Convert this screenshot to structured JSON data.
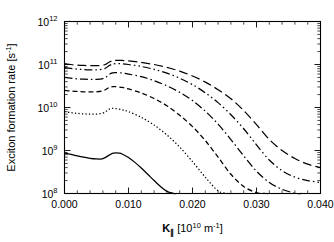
{
  "figure": {
    "background_color": "#ffffff",
    "line_color": "#000000"
  },
  "chart_data": {
    "type": "line",
    "title": "",
    "xlabel": "K∥ [10¹⁰ m⁻¹]",
    "ylabel": "Exciton formation rate [s⁻¹]",
    "xlabel_parts": {
      "symbol": "K",
      "subscript": "∥",
      "units_prefix": " [10",
      "units_exp": "10",
      "units_mid": " m",
      "units_exp2": "-1",
      "units_suffix": "]"
    },
    "ylabel_parts": {
      "text": "Exciton formation rate [s",
      "exp": "-1",
      "suffix": "]"
    },
    "xscale": "linear",
    "yscale": "log",
    "xlim": [
      0.0,
      0.04
    ],
    "ylim": [
      100000000.0,
      1000000000000.0
    ],
    "grid": false,
    "legend": "none",
    "xticks": [
      0.0,
      0.01,
      0.02,
      0.03,
      0.04
    ],
    "xticklabels": [
      "0.000",
      "0.010",
      "0.020",
      "0.030",
      "0.040"
    ],
    "x_minor_ticks_per_interval": 5,
    "yticks": [
      100000000.0,
      1000000000.0,
      10000000000.0,
      100000000000.0,
      1000000000000.0
    ],
    "yticklabels_base": [
      "10",
      "10",
      "10",
      "10",
      "10"
    ],
    "yticklabels_exp": [
      "8",
      "9",
      "10",
      "11",
      "12"
    ],
    "series": [
      {
        "name": "curve-long-dash",
        "linestyle": "long-dash",
        "dasharray": "9,4",
        "x": [
          0.0,
          0.001,
          0.002,
          0.003,
          0.004,
          0.005,
          0.006,
          0.0065,
          0.007,
          0.0075,
          0.008,
          0.009,
          0.01,
          0.012,
          0.014,
          0.016,
          0.018,
          0.02,
          0.022,
          0.024,
          0.026,
          0.028,
          0.03,
          0.032,
          0.034,
          0.036,
          0.038,
          0.04
        ],
        "y": [
          105000000000.0,
          100000000000.0,
          97000000000.0,
          95000000000.0,
          94000000000.0,
          94000000000.0,
          96000000000.0,
          102000000000.0,
          114000000000.0,
          122000000000.0,
          125000000000.0,
          124000000000.0,
          121000000000.0,
          112000000000.0,
          100000000000.0,
          86000000000.0,
          70000000000.0,
          54000000000.0,
          39000000000.0,
          26000000000.0,
          16000000000.0,
          8500000000.0,
          4000000000.0,
          1800000000.0,
          1000000000.0,
          650000000.0,
          480000000.0,
          400000000.0
        ]
      },
      {
        "name": "curve-dash-dot-dot",
        "linestyle": "dash-dot-dot",
        "dasharray": "8,3,1.5,3,1.5,3",
        "x": [
          0.0,
          0.001,
          0.002,
          0.003,
          0.004,
          0.005,
          0.006,
          0.0065,
          0.007,
          0.0075,
          0.008,
          0.009,
          0.01,
          0.012,
          0.014,
          0.016,
          0.018,
          0.02,
          0.022,
          0.024,
          0.026,
          0.028,
          0.03,
          0.032,
          0.034,
          0.036,
          0.038,
          0.04
        ],
        "y": [
          85000000000.0,
          81000000000.0,
          78000000000.0,
          76000000000.0,
          75000000000.0,
          75000000000.0,
          78000000000.0,
          84000000000.0,
          95000000000.0,
          102000000000.0,
          105000000000.0,
          104000000000.0,
          100000000000.0,
          90000000000.0,
          77000000000.0,
          63000000000.0,
          48000000000.0,
          34000000000.0,
          22000000000.0,
          13000000000.0,
          6800000000.0,
          3200000000.0,
          1350000000.0,
          600000000.0,
          340000000.0,
          240000000.0,
          200000000.0,
          180000000.0
        ]
      },
      {
        "name": "curve-dash-dot",
        "linestyle": "dash-dot",
        "dasharray": "8,3,1.5,3",
        "x": [
          0.0,
          0.001,
          0.002,
          0.003,
          0.004,
          0.005,
          0.006,
          0.0065,
          0.007,
          0.0075,
          0.008,
          0.009,
          0.01,
          0.012,
          0.014,
          0.016,
          0.018,
          0.02,
          0.022,
          0.024,
          0.026,
          0.028,
          0.03,
          0.032,
          0.034,
          0.036,
          0.037
        ],
        "y": [
          50000000000.0,
          48000000000.0,
          46500000000.0,
          45500000000.0,
          45000000000.0,
          45200000000.0,
          47000000000.0,
          51000000000.0,
          59000000000.0,
          64000000000.0,
          65000000000.0,
          63500000000.0,
          60000000000.0,
          52000000000.0,
          42000000000.0,
          32000000000.0,
          22500000000.0,
          14500000000.0,
          8200000000.0,
          4100000000.0,
          1800000000.0,
          750000000.0,
          330000000.0,
          180000000.0,
          125000000.0,
          102000000.0,
          100000000.0
        ]
      },
      {
        "name": "curve-short-dash",
        "linestyle": "short-dash",
        "dasharray": "5,3",
        "x": [
          0.0,
          0.001,
          0.002,
          0.003,
          0.004,
          0.005,
          0.006,
          0.0065,
          0.007,
          0.0075,
          0.008,
          0.009,
          0.01,
          0.012,
          0.014,
          0.016,
          0.018,
          0.02,
          0.022,
          0.024,
          0.026,
          0.028,
          0.03,
          0.0315,
          0.032
        ],
        "y": [
          25000000000.0,
          24200000000.0,
          23600000000.0,
          23200000000.0,
          23000000000.0,
          23200000000.0,
          24400000000.0,
          26500000000.0,
          29500000000.0,
          30500000000.0,
          30500000000.0,
          29200000000.0,
          27000000000.0,
          21800000000.0,
          16200000000.0,
          11000000000.0,
          6600000000.0,
          3600000000.0,
          1700000000.0,
          700000000.0,
          280000000.0,
          145000000.0,
          105000000.0,
          100000000.0,
          100000000.0
        ]
      },
      {
        "name": "curve-dotted",
        "linestyle": "dotted",
        "dasharray": "1.3,2.2",
        "x": [
          0.0,
          0.001,
          0.002,
          0.003,
          0.004,
          0.005,
          0.006,
          0.0065,
          0.007,
          0.0075,
          0.008,
          0.009,
          0.01,
          0.012,
          0.014,
          0.016,
          0.018,
          0.02,
          0.022,
          0.024,
          0.0255,
          0.026
        ],
        "y": [
          8000000000.0,
          7600000000.0,
          7300000000.0,
          7100000000.0,
          7000000000.0,
          7050000000.0,
          7400000000.0,
          8200000000.0,
          9200000000.0,
          9500000000.0,
          9450000000.0,
          8900000000.0,
          8000000000.0,
          5900000000.0,
          3900000000.0,
          2300000000.0,
          1200000000.0,
          550000000.0,
          240000000.0,
          115000000.0,
          100000000.0,
          100000000.0
        ]
      },
      {
        "name": "curve-solid",
        "linestyle": "solid",
        "dasharray": "none",
        "x": [
          0.0,
          0.001,
          0.002,
          0.003,
          0.004,
          0.005,
          0.0055,
          0.006,
          0.007,
          0.0075,
          0.008,
          0.0085,
          0.009,
          0.01,
          0.011,
          0.012,
          0.013,
          0.014,
          0.015,
          0.016,
          0.017,
          0.0175
        ],
        "y": [
          870000000.0,
          810000000.0,
          750000000.0,
          700000000.0,
          660000000.0,
          635000000.0,
          630000000.0,
          645000000.0,
          780000000.0,
          860000000.0,
          880000000.0,
          870000000.0,
          830000000.0,
          690000000.0,
          530000000.0,
          390000000.0,
          280000000.0,
          200000000.0,
          145000000.0,
          112000000.0,
          101000000.0,
          100000000.0
        ]
      }
    ]
  }
}
